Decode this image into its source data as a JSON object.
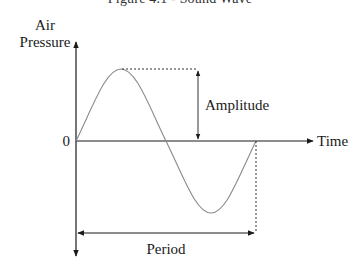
{
  "figure": {
    "title": "Figure 4.1 - Sound Wave",
    "y_axis_label_line1": "Air",
    "y_axis_label_line2": "Pressure",
    "x_axis_label": "Time",
    "origin_label": "0",
    "amplitude_label": "Amplitude",
    "period_label": "Period"
  },
  "colors": {
    "axis": "#1a1a1a",
    "wave": "#8a8a8a",
    "guide": "#333333"
  }
}
